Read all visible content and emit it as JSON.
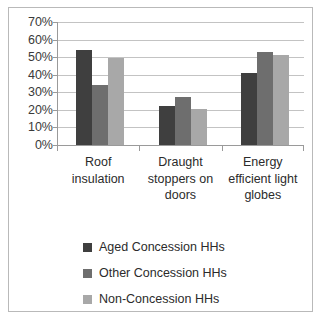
{
  "chart_data": {
    "type": "bar",
    "title": "",
    "subtitle": "",
    "xlabel": "",
    "ylabel": "",
    "ylim": [
      0,
      70
    ],
    "ytick_values": [
      0,
      10,
      20,
      30,
      40,
      50,
      60,
      70
    ],
    "ytick_labels": [
      "0%",
      "10%",
      "20%",
      "30%",
      "40%",
      "50%",
      "60%",
      "70%"
    ],
    "grid": true,
    "legend_position": "bottom",
    "categories": [
      "Roof insulation",
      "Draught stoppers on doors",
      "Energy efficient light globes"
    ],
    "category_lines": [
      [
        "Roof",
        "insulation"
      ],
      [
        "Draught",
        "stoppers on",
        "doors"
      ],
      [
        "Energy",
        "efficient light",
        "globes"
      ]
    ],
    "series": [
      {
        "name": "Aged Concession HHs",
        "color": "#3f3f3f",
        "values": [
          54,
          22,
          41
        ]
      },
      {
        "name": "Other Concession HHs",
        "color": "#6e6e6e",
        "values": [
          34,
          27.5,
          53
        ]
      },
      {
        "name": "Non-Concession HHs",
        "color": "#a8a8a8",
        "values": [
          49.5,
          20.5,
          51
        ]
      }
    ]
  },
  "frame": {
    "border_color": "#b9b9b9",
    "background_color": "#ffffff"
  }
}
